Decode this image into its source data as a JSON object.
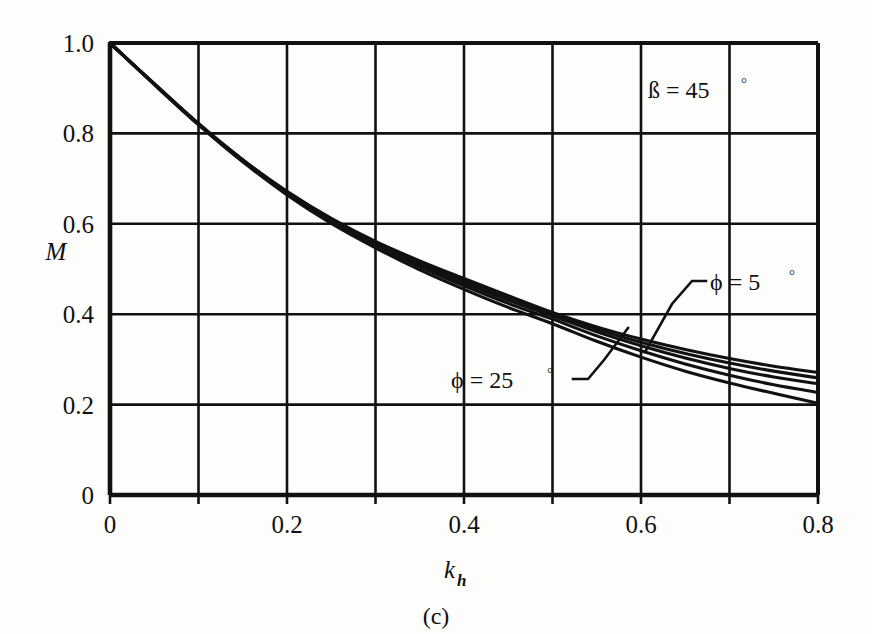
{
  "figure": {
    "caption": "(c)",
    "background_color": "#fdfdfb",
    "ink_color": "#111111"
  },
  "annotations": {
    "beta": {
      "text": "ß  =  45",
      "degree": "°",
      "x": 0.6,
      "y": 0.895
    },
    "phi_upper": {
      "text": "ϕ  =  5",
      "degree": "°",
      "label_x": 0.645,
      "label_y": 0.47
    },
    "phi_lower": {
      "text": "ϕ  =  25",
      "degree": "°",
      "label_x": 0.395,
      "label_y": 0.285
    }
  },
  "chart_data": {
    "type": "line",
    "title": "",
    "subtitle": "",
    "xlabel": "k",
    "xlabel_sub": "h",
    "ylabel": "M",
    "xlim": [
      0,
      0.8
    ],
    "ylim": [
      0,
      1.0
    ],
    "xticks": [
      0,
      0.2,
      0.4,
      0.6,
      0.8
    ],
    "xtick_labels": [
      "0",
      "0.2",
      "0.4",
      "0.6",
      "0.8"
    ],
    "yticks": [
      0,
      0.2,
      0.4,
      0.6,
      0.8,
      1.0
    ],
    "ytick_labels": [
      "0",
      "0.2",
      "0.4",
      "0.6",
      "0.8",
      "1.0"
    ],
    "grid": true,
    "grid_x_step": 0.1,
    "grid_y_step": 0.2,
    "legend": "inline-annotations",
    "x": [
      0,
      0.05,
      0.1,
      0.15,
      0.2,
      0.25,
      0.3,
      0.35,
      0.4,
      0.45,
      0.5,
      0.55,
      0.6,
      0.65,
      0.7,
      0.75,
      0.8
    ],
    "series": [
      {
        "name": "ϕ = 5°",
        "values": [
          1.0,
          0.91,
          0.822,
          0.742,
          0.672,
          0.612,
          0.561,
          0.518,
          0.479,
          0.441,
          0.404,
          0.372,
          0.345,
          0.322,
          0.302,
          0.285,
          0.271
        ]
      },
      {
        "name": "ϕ = 10°",
        "values": [
          1.0,
          0.91,
          0.821,
          0.741,
          0.67,
          0.61,
          0.558,
          0.514,
          0.474,
          0.437,
          0.401,
          0.367,
          0.338,
          0.313,
          0.292,
          0.274,
          0.259
        ]
      },
      {
        "name": "ϕ = 15°",
        "values": [
          1.0,
          0.909,
          0.82,
          0.74,
          0.669,
          0.608,
          0.555,
          0.51,
          0.469,
          0.431,
          0.396,
          0.361,
          0.33,
          0.303,
          0.28,
          0.261,
          0.246
        ]
      },
      {
        "name": "ϕ = 20°",
        "values": [
          1.0,
          0.909,
          0.82,
          0.739,
          0.667,
          0.605,
          0.552,
          0.505,
          0.463,
          0.424,
          0.389,
          0.352,
          0.319,
          0.29,
          0.265,
          0.244,
          0.227
        ]
      },
      {
        "name": "ϕ = 25°",
        "values": [
          1.0,
          0.908,
          0.819,
          0.737,
          0.664,
          0.601,
          0.547,
          0.498,
          0.455,
          0.415,
          0.379,
          0.34,
          0.305,
          0.274,
          0.248,
          0.225,
          0.203
        ]
      }
    ]
  }
}
